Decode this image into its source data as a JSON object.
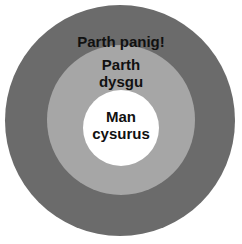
{
  "diagram": {
    "type": "concentric-circles",
    "rings": [
      {
        "id": "outer",
        "lines": [
          "Parth panig!"
        ],
        "color": "#6b6b6b"
      },
      {
        "id": "middle",
        "lines": [
          "Parth",
          "dysgu"
        ],
        "color": "#a6a6a6"
      },
      {
        "id": "inner",
        "lines": [
          "Man",
          "cysurus"
        ],
        "color": "#ffffff"
      }
    ]
  }
}
